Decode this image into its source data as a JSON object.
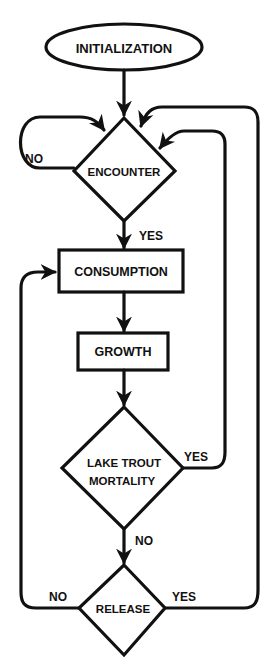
{
  "diagram": {
    "type": "flowchart",
    "colors": {
      "stroke": "#111111",
      "background": "#ffffff"
    },
    "nodes": [
      {
        "id": "initialization",
        "shape": "ellipse",
        "label": "INITIALIZATION"
      },
      {
        "id": "encounter",
        "shape": "diamond",
        "label": "ENCOUNTER"
      },
      {
        "id": "consumption",
        "shape": "rectangle",
        "label": "CONSUMPTION"
      },
      {
        "id": "growth",
        "shape": "rectangle",
        "label": "GROWTH"
      },
      {
        "id": "lake_trout_mortality",
        "shape": "diamond",
        "label_line1": "LAKE TROUT",
        "label_line2": "MORTALITY"
      },
      {
        "id": "release",
        "shape": "diamond",
        "label": "RELEASE"
      }
    ],
    "edges": [
      {
        "from": "initialization",
        "to": "encounter",
        "label": ""
      },
      {
        "from": "encounter",
        "to": "encounter",
        "label": "NO"
      },
      {
        "from": "encounter",
        "to": "consumption",
        "label": "YES"
      },
      {
        "from": "consumption",
        "to": "growth",
        "label": ""
      },
      {
        "from": "growth",
        "to": "lake_trout_mortality",
        "label": ""
      },
      {
        "from": "lake_trout_mortality",
        "to": "encounter",
        "label": "YES"
      },
      {
        "from": "lake_trout_mortality",
        "to": "release",
        "label": "NO"
      },
      {
        "from": "release",
        "to": "consumption",
        "label": "NO"
      },
      {
        "from": "release",
        "to": "encounter",
        "label": "YES"
      }
    ],
    "edge_labels": {
      "encounter_no": "NO",
      "encounter_yes": "YES",
      "mortality_yes": "YES",
      "mortality_no": "NO",
      "release_no": "NO",
      "release_yes": "YES"
    }
  }
}
